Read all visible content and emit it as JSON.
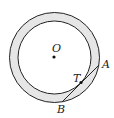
{
  "diagram": {
    "type": "concentric-circles-tangent-chord",
    "colors": {
      "annulus_fill": "#e6e6e6",
      "stroke": "#222222",
      "inner_fill": "#ffffff"
    },
    "labels": {
      "center": "O",
      "tangent_point": "T",
      "chord_end_a": "A",
      "chord_end_b": "B"
    }
  }
}
